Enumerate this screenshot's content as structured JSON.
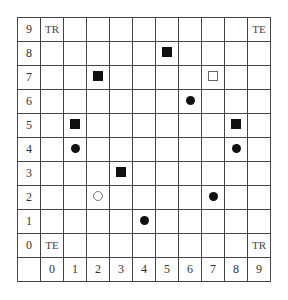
{
  "grid": {
    "rows": [
      9,
      8,
      7,
      6,
      5,
      4,
      3,
      2,
      1,
      0
    ],
    "columns": [
      0,
      1,
      2,
      3,
      4,
      5,
      6,
      7,
      8,
      9
    ],
    "corner_labels": [
      {
        "row": 9,
        "col": 0,
        "text": "TR"
      },
      {
        "row": 9,
        "col": 9,
        "text": "TE"
      },
      {
        "row": 0,
        "col": 0,
        "text": "TE"
      },
      {
        "row": 0,
        "col": 9,
        "text": "TR"
      }
    ],
    "markers": [
      {
        "row": 8,
        "col": 5,
        "shape": "filled-square"
      },
      {
        "row": 7,
        "col": 2,
        "shape": "filled-square"
      },
      {
        "row": 7,
        "col": 7,
        "shape": "hollow-square"
      },
      {
        "row": 6,
        "col": 6,
        "shape": "filled-circle"
      },
      {
        "row": 5,
        "col": 1,
        "shape": "filled-square"
      },
      {
        "row": 5,
        "col": 8,
        "shape": "filled-square"
      },
      {
        "row": 4,
        "col": 1,
        "shape": "filled-circle"
      },
      {
        "row": 4,
        "col": 8,
        "shape": "filled-circle"
      },
      {
        "row": 3,
        "col": 3,
        "shape": "filled-square"
      },
      {
        "row": 2,
        "col": 2,
        "shape": "hollow-circle"
      },
      {
        "row": 2,
        "col": 7,
        "shape": "filled-circle"
      },
      {
        "row": 1,
        "col": 4,
        "shape": "filled-circle"
      }
    ]
  }
}
